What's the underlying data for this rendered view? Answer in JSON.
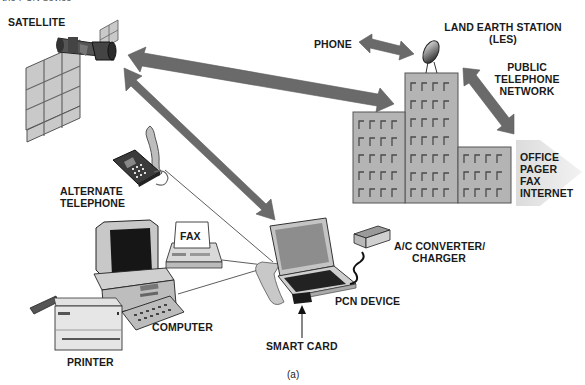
{
  "figure": {
    "cropped_top_text": "the PCN device",
    "caption": "(a)",
    "colors": {
      "arrow": "#6a6a6a",
      "building_fill": "#b4b4b4",
      "building_stroke": "#555555",
      "window": "#555555",
      "label_text": "#1a1a1a",
      "background": "#ffffff",
      "services_chevron": "#e4e4e4",
      "panel_fill": "#d8d8d8",
      "screen_dark": "#161616"
    }
  },
  "labels": {
    "satellite": "SATELLITE",
    "phone": "PHONE",
    "les_line1": "LAND EARTH STATION",
    "les_line2": "(LES)",
    "ptn_line1": "PUBLIC",
    "ptn_line2": "TELEPHONE",
    "ptn_line3": "NETWORK",
    "services": [
      "OFFICE",
      "PAGER",
      "FAX",
      "INTERNET"
    ],
    "alt_phone_line1": "ALTERNATE",
    "alt_phone_line2": "TELEPHONE",
    "fax": "FAX",
    "computer": "COMPUTER",
    "printer": "PRINTER",
    "ac_line1": "A/C CONVERTER/",
    "ac_line2": "CHARGER",
    "pcn_device": "PCN DEVICE",
    "smart_card": "SMART CARD"
  },
  "nodes": [
    {
      "id": "satellite",
      "label": "SATELLITE"
    },
    {
      "id": "land-earth-station",
      "label": "LAND EARTH STATION (LES)"
    },
    {
      "id": "phone",
      "label": "PHONE"
    },
    {
      "id": "public-telephone-network",
      "label": "PUBLIC TELEPHONE NETWORK"
    },
    {
      "id": "services",
      "label": "OFFICE / PAGER / FAX / INTERNET"
    },
    {
      "id": "pcn-device",
      "label": "PCN DEVICE"
    },
    {
      "id": "alternate-telephone",
      "label": "ALTERNATE TELEPHONE"
    },
    {
      "id": "fax",
      "label": "FAX"
    },
    {
      "id": "computer",
      "label": "COMPUTER"
    },
    {
      "id": "printer",
      "label": "PRINTER"
    },
    {
      "id": "ac-converter",
      "label": "A/C CONVERTER/ CHARGER"
    },
    {
      "id": "smart-card",
      "label": "SMART CARD"
    }
  ],
  "edges": [
    {
      "from": "satellite",
      "to": "land-earth-station",
      "type": "double-arrow"
    },
    {
      "from": "satellite",
      "to": "pcn-device",
      "type": "double-arrow"
    },
    {
      "from": "phone",
      "to": "land-earth-station",
      "type": "double-arrow"
    },
    {
      "from": "land-earth-station",
      "to": "public-telephone-network",
      "type": "double-arrow"
    },
    {
      "from": "alternate-telephone",
      "to": "pcn-device",
      "type": "line"
    },
    {
      "from": "fax",
      "to": "pcn-device",
      "type": "line"
    },
    {
      "from": "computer",
      "to": "pcn-device",
      "type": "line"
    },
    {
      "from": "ac-converter",
      "to": "pcn-device",
      "type": "cable"
    },
    {
      "from": "smart-card",
      "to": "pcn-device",
      "type": "pointer-arrow"
    }
  ]
}
